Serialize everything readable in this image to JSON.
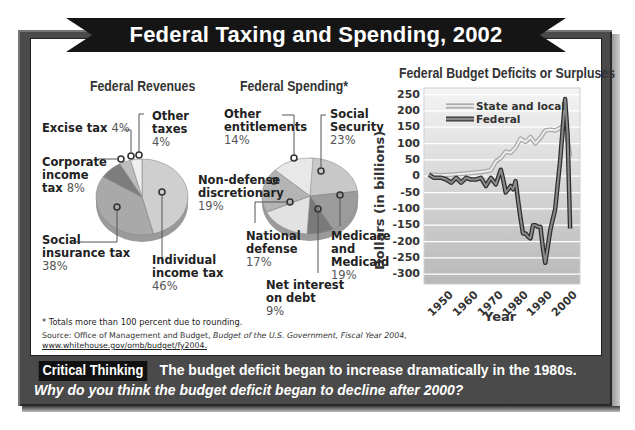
{
  "title": "Federal Taxing and Spending, 2002",
  "revenues": {
    "title": "Federal Revenues",
    "slices": [
      {
        "label": "Individual income tax",
        "line1": "Individual",
        "line2": "income tax",
        "pct": "46%",
        "value": 46,
        "color": "#cfcfcf"
      },
      {
        "label": "Social insurance tax",
        "line1": "Social",
        "line2": "insurance tax",
        "pct": "38%",
        "value": 38,
        "color": "#a9a9a9"
      },
      {
        "label": "Corporate income tax",
        "line1": "Corporate",
        "line2": "income",
        "line3": "tax",
        "pct": "8%",
        "value": 8,
        "color": "#7d7d7d"
      },
      {
        "label": "Excise tax",
        "line1": "Excise tax",
        "pct": "4%",
        "value": 4,
        "color": "#bdbdbd"
      },
      {
        "label": "Other taxes",
        "line1": "Other",
        "line2": "taxes",
        "pct": "4%",
        "value": 4,
        "color": "#efefef"
      }
    ]
  },
  "spending": {
    "title": "Federal Spending*",
    "slices": [
      {
        "label": "Social Security",
        "line1": "Social",
        "line2": "Security",
        "pct": "23%",
        "value": 23,
        "color": "#c8c8c8"
      },
      {
        "label": "Medicare and Medicaid",
        "line1": "Medicare",
        "line2": "and",
        "line3": "Medicaid",
        "pct": "19%",
        "value": 19,
        "color": "#9c9c9c"
      },
      {
        "label": "Net interest on debt",
        "line1": "Net interest",
        "line2": "on debt",
        "pct": "9%",
        "value": 9,
        "color": "#7a7a7a"
      },
      {
        "label": "National defense",
        "line1": "National",
        "line2": "defense",
        "pct": "17%",
        "value": 17,
        "color": "#e2e2e2"
      },
      {
        "label": "Non-defense discretionary",
        "line1": "Non-defense",
        "line2": "discretionary",
        "pct": "19%",
        "value": 19,
        "color": "#b4b4b4"
      },
      {
        "label": "Other entitlements",
        "line1": "Other",
        "line2": "entitlements",
        "pct": "14%",
        "value": 14,
        "color": "#e8e8e8"
      }
    ]
  },
  "chart_data": [
    {
      "type": "pie",
      "title": "Federal Revenues",
      "categories": [
        "Individual income tax",
        "Social insurance tax",
        "Corporate income tax",
        "Excise tax",
        "Other taxes"
      ],
      "values": [
        46,
        38,
        8,
        4,
        4
      ],
      "unit": "%"
    },
    {
      "type": "pie",
      "title": "Federal Spending*",
      "categories": [
        "Social Security",
        "Medicare and Medicaid",
        "Net interest on debt",
        "National defense",
        "Non-defense discretionary",
        "Other entitlements"
      ],
      "values": [
        23,
        19,
        9,
        17,
        19,
        14
      ],
      "unit": "%",
      "note": "Totals more than 100 percent due to rounding."
    },
    {
      "type": "line",
      "title": "Federal Budget Deficits or Surpluses",
      "xlabel": "Year",
      "ylabel": "Dollars (in billions)",
      "ylim": [
        -300,
        250
      ],
      "yticks": [
        250,
        200,
        150,
        100,
        50,
        0,
        -50,
        -100,
        -150,
        -200,
        -250,
        -300
      ],
      "xticks": [
        1950,
        1960,
        1970,
        1980,
        1990,
        2000
      ],
      "grid": true,
      "legend_position": "upper-left",
      "series": [
        {
          "name": "State and local",
          "x": [
            1945,
            1950,
            1955,
            1960,
            1965,
            1968,
            1970,
            1972,
            1974,
            1976,
            1978,
            1980,
            1982,
            1984,
            1986,
            1988,
            1990,
            1992,
            1994,
            1996,
            1998,
            2000,
            2002
          ],
          "values": [
            5,
            3,
            5,
            8,
            12,
            15,
            18,
            45,
            55,
            75,
            72,
            88,
            115,
            105,
            120,
            100,
            118,
            140,
            142,
            140,
            148,
            160,
            60
          ]
        },
        {
          "name": "Federal",
          "x": [
            1945,
            1947,
            1950,
            1952,
            1954,
            1956,
            1958,
            1960,
            1962,
            1964,
            1966,
            1968,
            1970,
            1972,
            1974,
            1975,
            1976,
            1978,
            1979,
            1980,
            1981,
            1982,
            1983,
            1984,
            1985,
            1986,
            1987,
            1988,
            1989,
            1990,
            1991,
            1992,
            1994,
            1996,
            1998,
            2000,
            2001,
            2002
          ],
          "values": [
            5,
            -5,
            -5,
            -10,
            -20,
            -5,
            -20,
            -5,
            -10,
            -10,
            -5,
            -30,
            -5,
            -25,
            20,
            -10,
            -50,
            -30,
            -40,
            -15,
            -75,
            -130,
            -175,
            -175,
            -185,
            -190,
            -150,
            -150,
            -155,
            -155,
            -220,
            -265,
            -165,
            -100,
            50,
            236,
            125,
            -160
          ]
        }
      ]
    }
  ],
  "deficit_chart": {
    "title": "Federal Budget Deficits or Surpluses",
    "ylabel": "Dollars (in billions)",
    "xlabel": "Year",
    "yticks": [
      "250",
      "200",
      "150",
      "100",
      "50",
      "0",
      "-50",
      "-100",
      "-150",
      "-200",
      "-250",
      "-300"
    ],
    "xticks": [
      "1950",
      "1960",
      "1970",
      "1980",
      "1990",
      "2000"
    ],
    "legend": {
      "state": "State and local",
      "federal": "Federal"
    },
    "colors": {
      "state": "#d0d0d0",
      "federal": "#6a6a6a",
      "plot_bg_top": "#f2f2f2",
      "plot_bg_bottom": "#bdbdbd"
    }
  },
  "footnote": "* Totals more than 100 percent due to rounding.",
  "source": {
    "prefix": "Source: Office of Management and Budget,",
    "title": "Budget of the U.S. Government, Fiscal Year 2004,",
    "url": "www.whitehouse.gov/omb/budget/fy2004."
  },
  "critical_thinking": {
    "badge": "Critical Thinking",
    "statement": "The budget deficit began to increase dramatically in the 1980s.",
    "question": "Why do you think the budget deficit began to decline after 2000?"
  },
  "colors": {
    "frame": "#4a4a4a",
    "banner": "#151515",
    "panel": "#ffffff"
  }
}
